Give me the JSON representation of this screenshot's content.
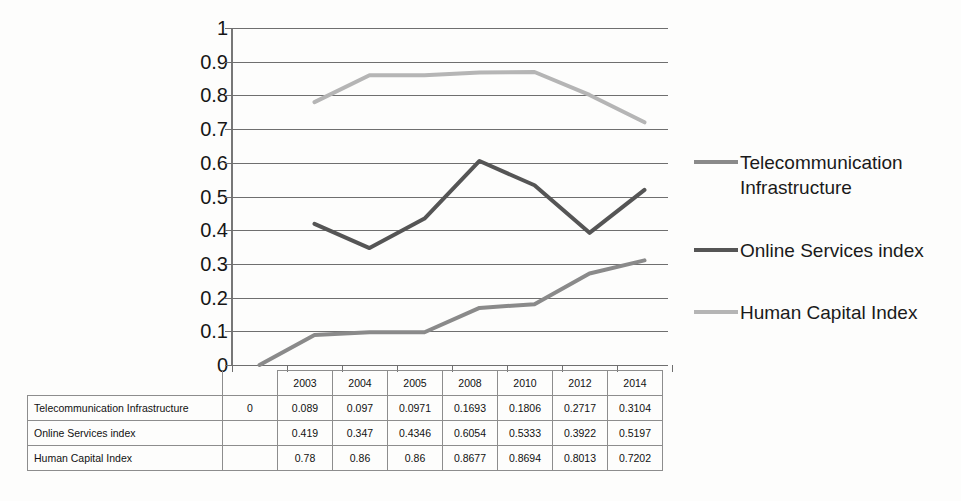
{
  "chart_data": {
    "type": "line",
    "title": "",
    "xlabel": "",
    "ylabel": "",
    "categories": [
      "2003",
      "2004",
      "2005",
      "2008",
      "2010",
      "2012",
      "2014"
    ],
    "ylim": [
      0,
      1
    ],
    "y_ticks": [
      "0",
      "0.1",
      "0.2",
      "0.3",
      "0.4",
      "0.5",
      "0.6",
      "0.7",
      "0.8",
      "0.9",
      "1"
    ],
    "grid": true,
    "legend_position": "right",
    "series": [
      {
        "name": "Telecommunication Infrastructure",
        "color": "#8a8a8a",
        "origin_value": 0,
        "values": [
          0.089,
          0.097,
          0.0971,
          0.1693,
          0.1806,
          0.2717,
          0.3104
        ]
      },
      {
        "name": "Online Services index",
        "color": "#555555",
        "origin_value": null,
        "values": [
          0.419,
          0.347,
          0.4346,
          0.6054,
          0.5333,
          0.3922,
          0.5197
        ]
      },
      {
        "name": "Human Capital Index",
        "color": "#b5b5b5",
        "origin_value": null,
        "values": [
          0.78,
          0.86,
          0.86,
          0.8677,
          0.8694,
          0.8013,
          0.7202
        ]
      }
    ]
  },
  "legend": {
    "entries": [
      {
        "label": "Telecommunication\nInfrastructure",
        "color": "#8a8a8a"
      },
      {
        "label": "Online Services index",
        "color": "#555555"
      },
      {
        "label": "Human Capital Index",
        "color": "#b5b5b5"
      }
    ]
  },
  "table": {
    "year_headers": [
      "2003",
      "2004",
      "2005",
      "2008",
      "2010",
      "2012",
      "2014"
    ],
    "rows": [
      {
        "label": "Telecommunication Infrastructure",
        "origin": "0",
        "values": [
          "0.089",
          "0.097",
          "0.0971",
          "0.1693",
          "0.1806",
          "0.2717",
          "0.3104"
        ]
      },
      {
        "label": "Online Services index",
        "origin": "",
        "values": [
          "0.419",
          "0.347",
          "0.4346",
          "0.6054",
          "0.5333",
          "0.3922",
          "0.5197"
        ]
      },
      {
        "label": "Human Capital Index",
        "origin": "",
        "values": [
          "0.78",
          "0.86",
          "0.86",
          "0.8677",
          "0.8694",
          "0.8013",
          "0.7202"
        ]
      }
    ]
  }
}
